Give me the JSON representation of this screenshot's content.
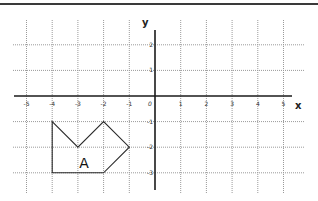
{
  "figure": {
    "x_axis_label": "x",
    "y_axis_label": "y",
    "x_range": [
      -5,
      5
    ],
    "y_range": [
      -3,
      2
    ],
    "origin_label": "0",
    "x_ticks": [
      {
        "value": -5,
        "label": "-5"
      },
      {
        "value": -4,
        "label": "-4"
      },
      {
        "value": -3,
        "label": "-3"
      },
      {
        "value": -2,
        "label": "-2"
      },
      {
        "value": -1,
        "label": "-1"
      },
      {
        "value": 1,
        "label": "1"
      },
      {
        "value": 2,
        "label": "2"
      },
      {
        "value": 3,
        "label": "3"
      },
      {
        "value": 4,
        "label": "4"
      },
      {
        "value": 5,
        "label": "5"
      }
    ],
    "y_ticks": [
      {
        "value": 2,
        "label": "2"
      },
      {
        "value": 1,
        "label": "1"
      },
      {
        "value": -1,
        "label": "-1"
      },
      {
        "value": -2,
        "label": "-2"
      },
      {
        "value": -3,
        "label": "-3"
      }
    ],
    "shape": {
      "label": "A",
      "label_position": [
        -2.75,
        -2.6
      ],
      "vertices": [
        [
          -4,
          -1
        ],
        [
          -3,
          -2
        ],
        [
          -2,
          -1
        ],
        [
          -1,
          -2
        ],
        [
          -2,
          -3
        ],
        [
          -4,
          -3
        ]
      ]
    },
    "colors": {
      "grid": "#9a9a9a",
      "axis": "#1a1a1a",
      "shape": "#2a2a2a"
    }
  }
}
